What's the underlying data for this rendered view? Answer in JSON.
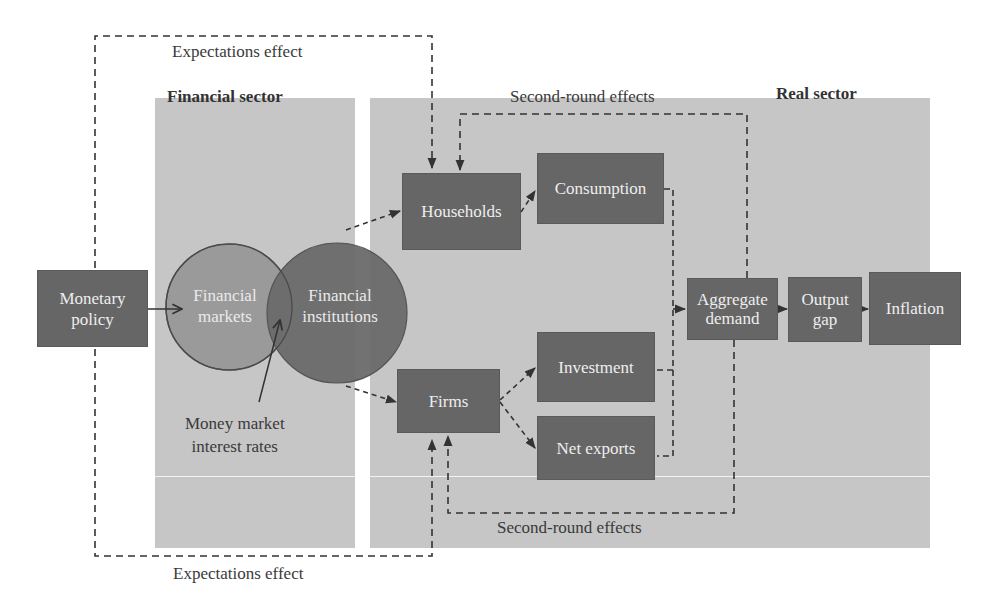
{
  "diagram": {
    "type": "monetary-policy-transmission-mechanism",
    "sectors": {
      "financial": {
        "label": "Financial sector"
      },
      "real": {
        "label": "Real sector"
      }
    },
    "annotations": {
      "expectations_top": "Expectations effect",
      "expectations_bottom": "Expectations effect",
      "second_round_top": "Second-round effects",
      "second_round_bottom": "Second-round effects",
      "money_market_line1": "Money market",
      "money_market_line2": "interest rates"
    },
    "nodes": {
      "monetary_policy": {
        "line1": "Monetary",
        "line2": "policy"
      },
      "financial_markets": {
        "line1": "Financial",
        "line2": "markets"
      },
      "financial_institutions": {
        "line1": "Financial",
        "line2": "institutions"
      },
      "households": {
        "label": "Households"
      },
      "firms": {
        "label": "Firms"
      },
      "consumption": {
        "label": "Consumption"
      },
      "investment": {
        "label": "Investment"
      },
      "net_exports": {
        "label": "Net exports"
      },
      "aggregate_demand": {
        "line1": "Aggregate",
        "line2": "demand"
      },
      "output_gap": {
        "line1": "Output",
        "line2": "gap"
      },
      "inflation": {
        "label": "Inflation"
      }
    },
    "edges": [
      {
        "from": "Monetary policy",
        "to": "Financial markets",
        "style": "solid"
      },
      {
        "from": "Money market interest rates",
        "to": "Financial markets/institutions overlap",
        "style": "solid"
      },
      {
        "from": "Financial institutions",
        "to": "Households",
        "style": "dashed"
      },
      {
        "from": "Financial institutions",
        "to": "Firms",
        "style": "dashed"
      },
      {
        "from": "Households",
        "to": "Consumption",
        "style": "dashed"
      },
      {
        "from": "Firms",
        "to": "Investment",
        "style": "dashed"
      },
      {
        "from": "Firms",
        "to": "Net exports",
        "style": "dashed"
      },
      {
        "from": "Consumption/Investment/Net exports",
        "to": "Aggregate demand",
        "style": "dashed"
      },
      {
        "from": "Aggregate demand",
        "to": "Output gap",
        "style": "solid"
      },
      {
        "from": "Output gap",
        "to": "Inflation",
        "style": "solid"
      },
      {
        "from": "Monetary policy",
        "to": "Households",
        "style": "dashed",
        "label": "Expectations effect"
      },
      {
        "from": "Monetary policy",
        "to": "Firms",
        "style": "dashed",
        "label": "Expectations effect"
      },
      {
        "from": "Aggregate demand",
        "to": "Households",
        "style": "dashed",
        "label": "Second-round effects"
      },
      {
        "from": "Aggregate demand",
        "to": "Firms",
        "style": "dashed",
        "label": "Second-round effects"
      }
    ],
    "colors": {
      "panel": "#c6c6c6",
      "box": "#666666",
      "circle_markets": "#9a9a9a",
      "circle_institutions": "#6a6a6a",
      "text_dark": "#3a3a3a",
      "text_light": "#eeeeee"
    }
  }
}
